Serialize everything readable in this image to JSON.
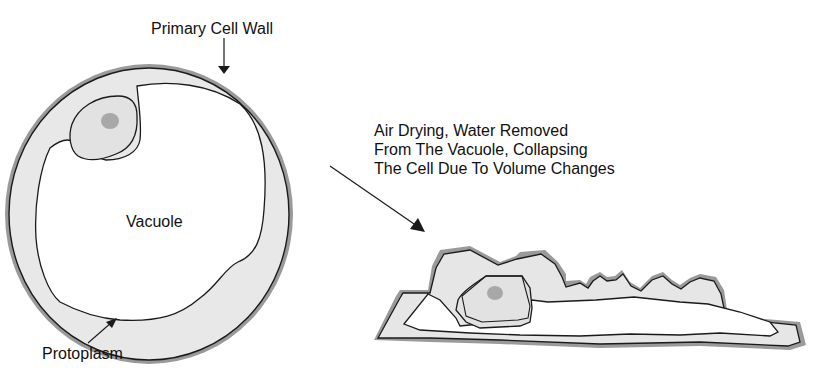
{
  "labels": {
    "cell_wall": "Primary Cell Wall",
    "vacuole": "Vacuole",
    "protoplasm": "Protoplasm",
    "process_line1": "Air Drying, Water Removed",
    "process_line2": "From The Vacuole, Collapsing",
    "process_line3": "The Cell Due To Volume Changes"
  },
  "colors": {
    "outline": "#1a1a1a",
    "wall_shade": "#8a8a8a",
    "protoplasm_fill": "#e6e6e6",
    "nucleolus": "#a8a8a8"
  }
}
